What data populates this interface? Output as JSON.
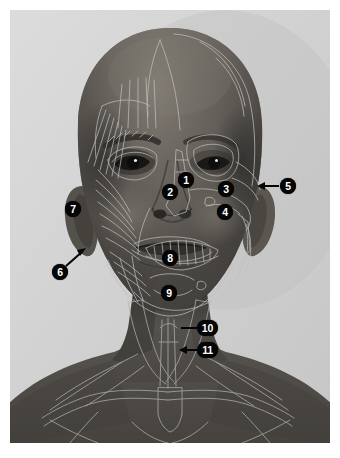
{
  "figure": {
    "plate_background_color": "#d4d4d4",
    "page_background_color": "#ffffff",
    "marker_fill_color": "#050505",
    "marker_text_color": "#ffffff",
    "overlay_line_color": "#b9b9b9"
  },
  "markers": [
    {
      "id": "1",
      "label": "1",
      "shape": "round",
      "x": 178,
      "y": 172,
      "leader": "none"
    },
    {
      "id": "2",
      "label": "2",
      "shape": "round",
      "x": 162,
      "y": 184,
      "leader": "none"
    },
    {
      "id": "3",
      "label": "3",
      "shape": "round",
      "x": 218,
      "y": 181,
      "leader": "none"
    },
    {
      "id": "4",
      "label": "4",
      "shape": "round",
      "x": 217,
      "y": 204,
      "leader": "none"
    },
    {
      "id": "5",
      "label": "5",
      "shape": "round",
      "x": 280,
      "y": 178,
      "leader": "arrow-left"
    },
    {
      "id": "6",
      "label": "6",
      "shape": "round",
      "x": 52,
      "y": 264,
      "leader": "arrow-up-right"
    },
    {
      "id": "7",
      "label": "7",
      "shape": "round",
      "x": 65,
      "y": 201,
      "leader": "none"
    },
    {
      "id": "8",
      "label": "8",
      "shape": "round",
      "x": 162,
      "y": 250,
      "leader": "none"
    },
    {
      "id": "9",
      "label": "9",
      "shape": "round",
      "x": 161,
      "y": 285,
      "leader": "none"
    },
    {
      "id": "10",
      "label": "10",
      "shape": "wide",
      "x": 197,
      "y": 320,
      "leader": "line-left"
    },
    {
      "id": "11",
      "label": "11",
      "shape": "wide",
      "x": 198,
      "y": 342,
      "leader": "arrow-left"
    }
  ]
}
